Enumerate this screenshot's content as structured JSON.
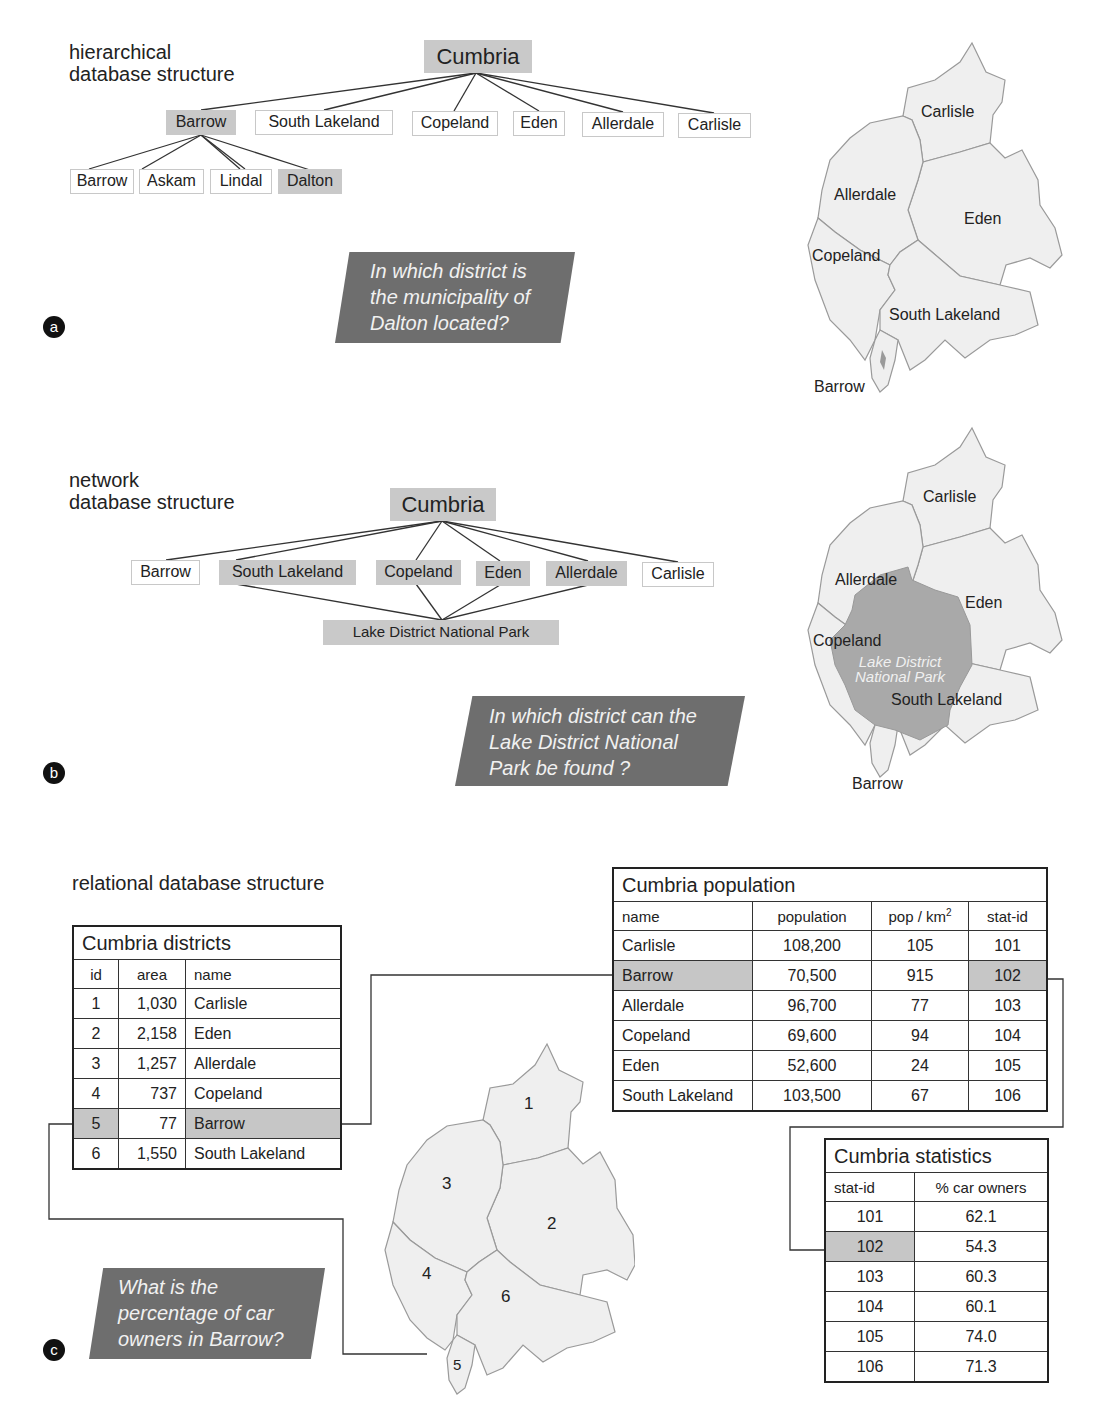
{
  "colors": {
    "highlight": "#c9c9c9",
    "question_bg": "#6e6e6e",
    "map_fill": "#efefef",
    "map_stroke": "#9a9a9a",
    "park_fill": "#a9a9a9"
  },
  "section_a": {
    "badge": "a",
    "title_line1": "hierarchical",
    "title_line2": "database structure",
    "root": "Cumbria",
    "level1": [
      "Barrow",
      "South Lakeland",
      "Copeland",
      "Eden",
      "Allerdale",
      "Carlisle"
    ],
    "level1_highlight": [
      "Barrow"
    ],
    "level2_parent": "Barrow",
    "level2": [
      "Barrow",
      "Askam",
      "Lindal",
      "Dalton"
    ],
    "level2_highlight": [
      "Dalton"
    ],
    "question": [
      "In which district is",
      "the municipality of",
      "Dalton located?"
    ],
    "map_labels": {
      "carlisle": "Carlisle",
      "allerdale": "Allerdale",
      "eden": "Eden",
      "copeland": "Copeland",
      "south_lakeland": "South Lakeland",
      "barrow": "Barrow"
    }
  },
  "section_b": {
    "badge": "b",
    "title_line1": "network",
    "title_line2": "database structure",
    "root": "Cumbria",
    "level1": [
      "Barrow",
      "South Lakeland",
      "Copeland",
      "Eden",
      "Allerdale",
      "Carlisle"
    ],
    "level1_highlight": [
      "South Lakeland",
      "Copeland",
      "Eden",
      "Allerdale"
    ],
    "child": "Lake District National Park",
    "question": [
      "In which district can the",
      "Lake District National",
      "Park be found ?"
    ],
    "map_labels": {
      "carlisle": "Carlisle",
      "allerdale": "Allerdale",
      "eden": "Eden",
      "copeland": "Copeland",
      "south_lakeland": "South Lakeland",
      "barrow": "Barrow",
      "park_line1": "Lake District",
      "park_line2": "National Park"
    }
  },
  "section_c": {
    "badge": "c",
    "title": "relational database structure",
    "question": [
      "What is the",
      "percentage of car",
      "owners in Barrow?"
    ],
    "districts_table": {
      "title": "Cumbria districts",
      "columns": [
        "id",
        "area",
        "name"
      ],
      "rows": [
        {
          "id": "1",
          "area": "1,030",
          "name": "Carlisle"
        },
        {
          "id": "2",
          "area": "2,158",
          "name": "Eden"
        },
        {
          "id": "3",
          "area": "1,257",
          "name": "Allerdale"
        },
        {
          "id": "4",
          "area": "737",
          "name": "Copeland"
        },
        {
          "id": "5",
          "area": "77",
          "name": "Barrow",
          "highlight": true
        },
        {
          "id": "6",
          "area": "1,550",
          "name": "South Lakeland"
        }
      ]
    },
    "population_table": {
      "title": "Cumbria population",
      "columns": [
        "name",
        "population",
        "pop / km",
        "stat-id"
      ],
      "column_superscript": "2",
      "rows": [
        {
          "name": "Carlisle",
          "population": "108,200",
          "density": "105",
          "stat_id": "101"
        },
        {
          "name": "Barrow",
          "population": "70,500",
          "density": "915",
          "stat_id": "102",
          "highlight": true
        },
        {
          "name": "Allerdale",
          "population": "96,700",
          "density": "77",
          "stat_id": "103"
        },
        {
          "name": "Copeland",
          "population": "69,600",
          "density": "94",
          "stat_id": "104"
        },
        {
          "name": "Eden",
          "population": "52,600",
          "density": "24",
          "stat_id": "105"
        },
        {
          "name": "South Lakeland",
          "population": "103,500",
          "density": "67",
          "stat_id": "106"
        }
      ]
    },
    "statistics_table": {
      "title": "Cumbria statistics",
      "columns": [
        "stat-id",
        "% car owners"
      ],
      "rows": [
        {
          "stat_id": "101",
          "car_owners": "62.1"
        },
        {
          "stat_id": "102",
          "car_owners": "54.3",
          "highlight": true
        },
        {
          "stat_id": "103",
          "car_owners": "60.3"
        },
        {
          "stat_id": "104",
          "car_owners": "60.1"
        },
        {
          "stat_id": "105",
          "car_owners": "74.0"
        },
        {
          "stat_id": "106",
          "car_owners": "71.3"
        }
      ]
    },
    "map_numbers": {
      "d1": "1",
      "d2": "2",
      "d3": "3",
      "d4": "4",
      "d5": "5",
      "d6": "6"
    }
  }
}
